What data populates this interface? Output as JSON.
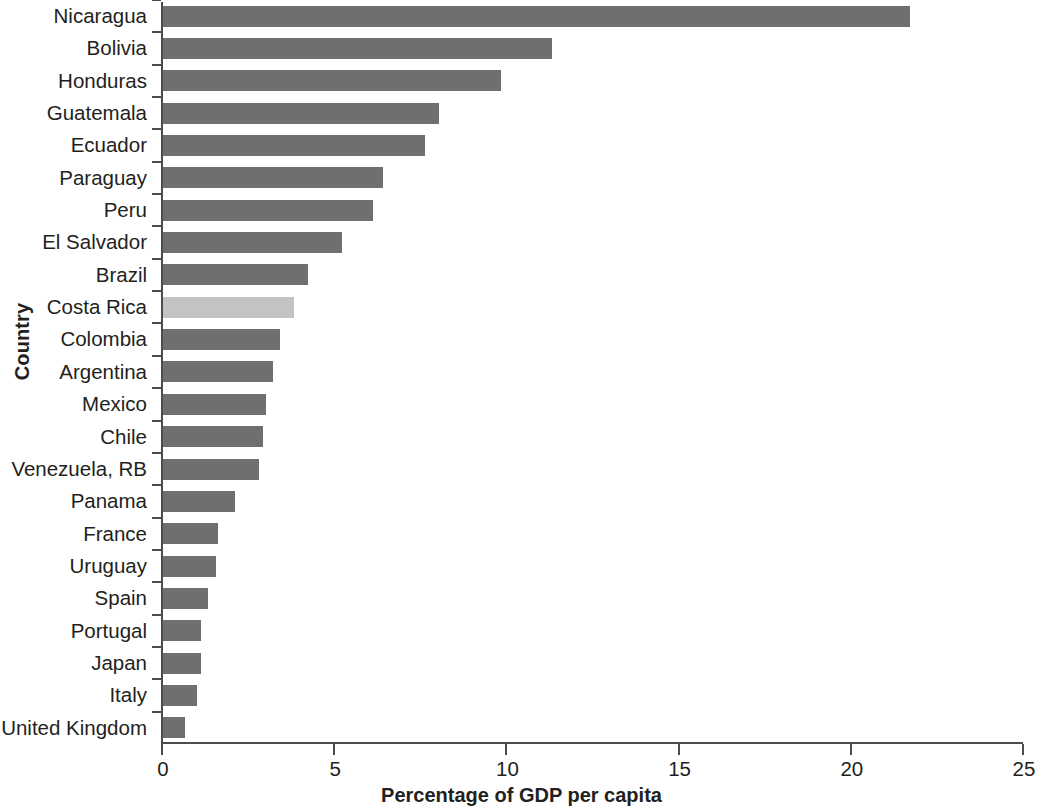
{
  "chart_data": {
    "type": "bar",
    "orientation": "horizontal",
    "title": "",
    "xlabel": "Percentage of GDP per capita",
    "ylabel": "Country",
    "xlim": [
      0,
      25
    ],
    "xticks": [
      0,
      5,
      10,
      15,
      20,
      25
    ],
    "xtick_labels": [
      "0",
      "5",
      "10",
      "15",
      "20",
      "25"
    ],
    "grid": false,
    "legend": "none",
    "categories": [
      "Nicaragua",
      "Bolivia",
      "Honduras",
      "Guatemala",
      "Ecuador",
      "Paraguay",
      "Peru",
      "El Salvador",
      "Brazil",
      "Costa Rica",
      "Colombia",
      "Argentina",
      "Mexico",
      "Chile",
      "Venezuela, RB",
      "Panama",
      "France",
      "Uruguay",
      "Spain",
      "Portugal",
      "Japan",
      "Italy",
      "United Kingdom"
    ],
    "values": [
      21.7,
      11.3,
      9.8,
      8.0,
      7.6,
      6.4,
      6.1,
      5.2,
      4.2,
      3.8,
      3.4,
      3.2,
      3.0,
      2.9,
      2.8,
      2.1,
      1.6,
      1.55,
      1.3,
      1.1,
      1.1,
      1.0,
      0.65
    ],
    "highlight_category": "Costa Rica",
    "colors": {
      "bar": "#6f6f6f",
      "bar_highlight": "#c3c3c3",
      "axis": "#4d4d4d",
      "text": "#231f20",
      "background": "#ffffff"
    }
  }
}
